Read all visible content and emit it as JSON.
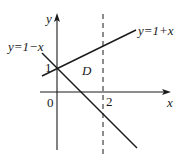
{
  "diagram": {
    "type": "coordinate-graph",
    "axes": {
      "x_label": "x",
      "y_label": "y",
      "origin_label": "0"
    },
    "ticks": {
      "y_one": "1",
      "x_two": "2"
    },
    "lines": [
      {
        "id": "line-1-plus-x",
        "label": "y=1+x",
        "style": "solid"
      },
      {
        "id": "line-1-minus-x",
        "label": "y=1−x",
        "style": "solid"
      },
      {
        "id": "line-x-2",
        "label": "x=2",
        "style": "dashed"
      }
    ],
    "region_label": "D",
    "colors": {
      "stroke": "#1a1a1a",
      "background": "#ffffff"
    }
  }
}
